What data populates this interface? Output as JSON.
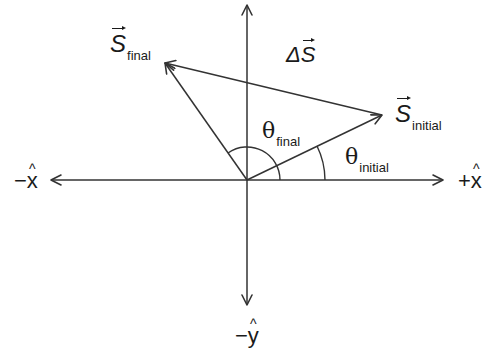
{
  "diagram": {
    "colors": {
      "line": "#333333",
      "text": "#1a1a1a",
      "background": "#ffffff"
    },
    "origin": {
      "x": 247,
      "y": 180
    },
    "axes": {
      "pos_x": {
        "label_sign": "+",
        "label_var": "x",
        "hat": "^"
      },
      "neg_x": {
        "label_sign": "−",
        "label_var": "x",
        "hat": "^"
      },
      "neg_y": {
        "label_sign": "−",
        "label_var": "y",
        "hat": "^"
      }
    },
    "vectors": {
      "s_final": {
        "symbol": "S",
        "subscript": "final"
      },
      "s_initial": {
        "symbol": "S",
        "subscript": "initial"
      },
      "delta_s": {
        "prefix": "Δ",
        "symbol": "S"
      }
    },
    "angles": {
      "theta_final": {
        "symbol": "θ",
        "subscript": "final"
      },
      "theta_initial": {
        "symbol": "θ",
        "subscript": "initial"
      }
    }
  }
}
